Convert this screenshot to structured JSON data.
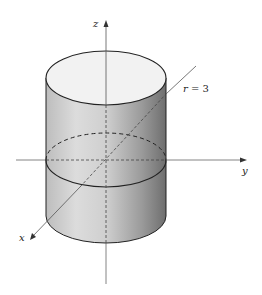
{
  "diagram": {
    "labels": {
      "z_axis": "z",
      "y_axis": "y",
      "x_axis": "x",
      "radius_var": "r",
      "radius_eq": " = 3"
    },
    "colors": {
      "surface_light": "#eeeeee",
      "surface_dark": "#7a7a7a",
      "top_face": "#f4f4f4",
      "stroke": "#222222",
      "axis": "#555555"
    }
  }
}
